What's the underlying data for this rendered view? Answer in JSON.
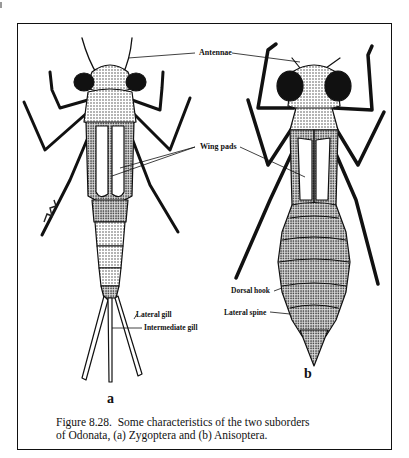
{
  "figure": {
    "number": "Figure 8.28.",
    "caption_line1": "Figure 8.28.  Some characteristics of the two suborders",
    "caption_line2": "of Odonata, (a) Zygoptera and (b) Anisoptera.",
    "panels": [
      {
        "id": "a",
        "label": "a",
        "taxon": "Zygoptera"
      },
      {
        "id": "b",
        "label": "b",
        "taxon": "Anisoptera"
      }
    ],
    "annotations": {
      "antennae": "Antennae",
      "wing_pads": "Wing pads",
      "lateral_gill": "Lateral gill",
      "intermediate_gill": "Intermediate gill",
      "dorsal_hook": "Dorsal hook",
      "lateral_spine": "Lateral spine"
    },
    "artist_signature": "signature",
    "colors": {
      "ink": "#111111",
      "paper": "#ffffff",
      "shade": "#555555"
    }
  }
}
